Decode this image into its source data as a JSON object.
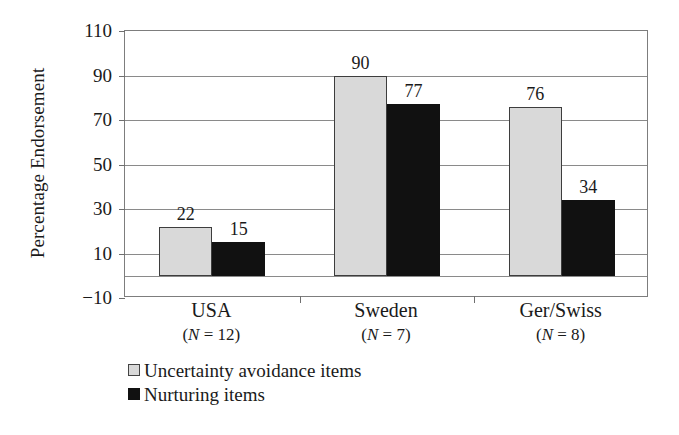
{
  "chart_data": {
    "type": "bar",
    "title": "",
    "subtitle": "",
    "xlabel": "",
    "ylabel": "Percentage Endorsement",
    "ylim": [
      -10,
      110
    ],
    "ytick_values": [
      110,
      90,
      70,
      50,
      30,
      10,
      -10
    ],
    "ytick_labels": [
      "110",
      "90",
      "70",
      "50",
      "30",
      "10",
      "−10"
    ],
    "grid": "horizontal",
    "legend_position": "bottom-left",
    "categories": [
      "USA",
      "Sweden",
      "Ger/Swiss"
    ],
    "category_sublabels": [
      "(N = 12)",
      "(N = 7)",
      "(N = 8)"
    ],
    "category_n": [
      12,
      7,
      8
    ],
    "series": [
      {
        "name": "Uncertainty avoidance items",
        "color": "#d9d9d9",
        "edge_color": "#3d3d3d",
        "values": [
          22,
          90,
          76
        ]
      },
      {
        "name": "Nurturing items",
        "color": "#111111",
        "edge_color": "#111111",
        "values": [
          15,
          77,
          34
        ]
      }
    ],
    "data_labels": [
      [
        "22",
        "90",
        "76"
      ],
      [
        "15",
        "77",
        "34"
      ]
    ]
  },
  "axis": {
    "y_title": "Percentage Endorsement"
  },
  "legend": {
    "items": [
      {
        "label": "Uncertainty avoidance items"
      },
      {
        "label": "Nurturing items"
      }
    ]
  }
}
